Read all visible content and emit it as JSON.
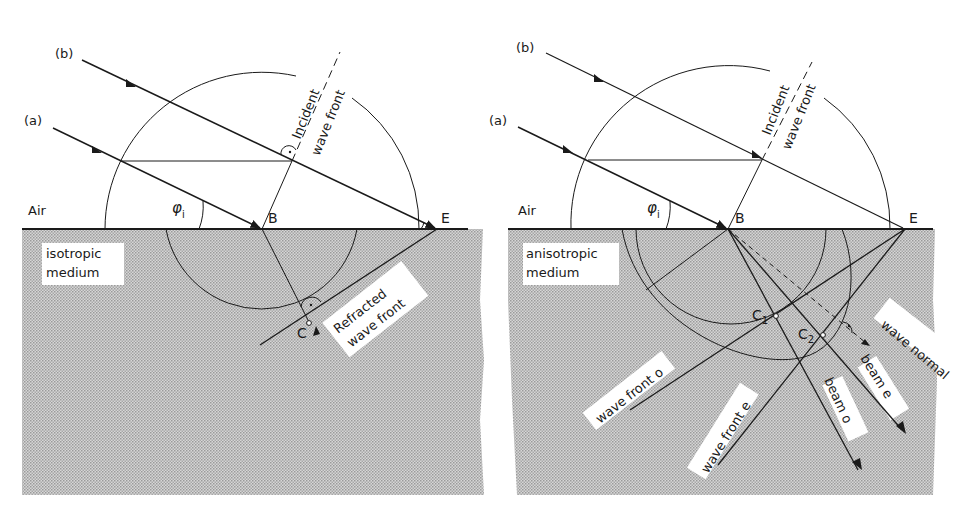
{
  "figure": {
    "colors": {
      "ink": "#1a1a1a",
      "medium_fill": "#c9c9c9",
      "paper": "#ffffff"
    },
    "panels": [
      {
        "id": "isotropic",
        "ray_b_label": "(b)",
        "ray_a_label": "(a)",
        "incident_label_1": "Incident",
        "incident_label_2": "wave front",
        "air_label": "Air",
        "angle_label": "φ",
        "angle_sub": "i",
        "point_b": "B",
        "point_e": "E",
        "point_c": "C",
        "medium_label_1": "isotropic",
        "medium_label_2": "medium",
        "refracted_label_1": "Refracted",
        "refracted_label_2": "wave front"
      },
      {
        "id": "anisotropic",
        "ray_b_label": "(b)",
        "ray_a_label": "(a)",
        "incident_label_1": "Incident",
        "incident_label_2": "wave front",
        "air_label": "Air",
        "angle_label": "φ",
        "angle_sub": "i",
        "point_b": "B",
        "point_e": "E",
        "point_c1": "C",
        "point_c1_sub": "1",
        "point_c2": "C",
        "point_c2_sub": "2",
        "medium_label_1": "anisotropic",
        "medium_label_2": "medium",
        "wave_front_o": "wave front o",
        "wave_front_e": "wave front e",
        "beam_o": "beam o",
        "beam_e": "beam e",
        "wave_normal": "wave normal"
      }
    ]
  }
}
